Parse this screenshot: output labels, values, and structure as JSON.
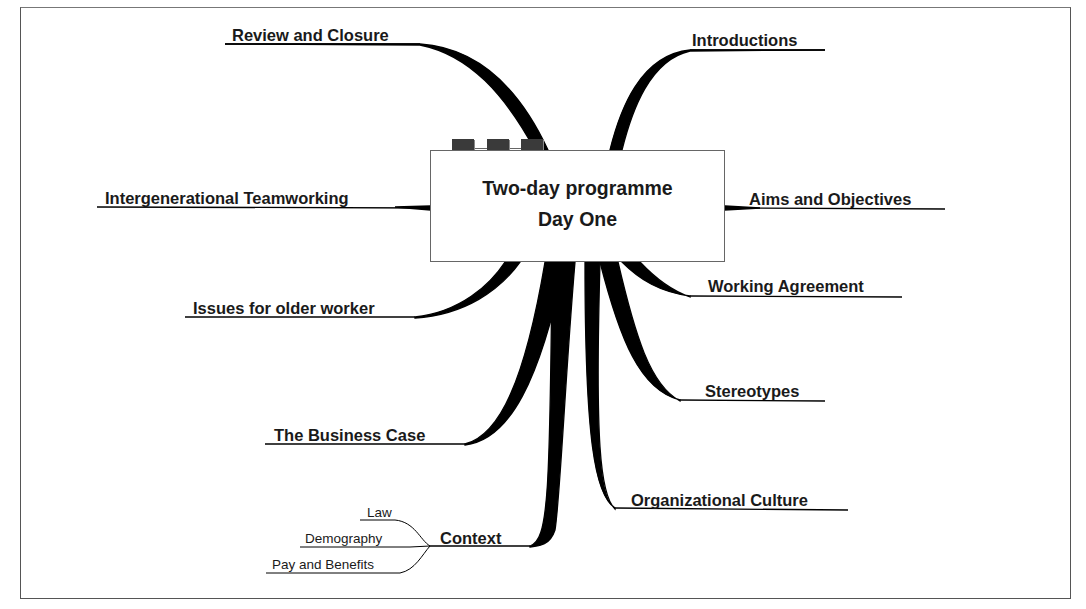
{
  "central_topic": {
    "line1": "Two-day programme",
    "line2": "Day One"
  },
  "branches": {
    "review": "Review and Closure",
    "introductions": "Introductions",
    "intergenerational": "Intergenerational Teamworking",
    "aims": "Aims and Objectives",
    "issues": "Issues for older worker",
    "working_agreement": "Working Agreement",
    "stereotypes": "Stereotypes",
    "business_case": "The Business Case",
    "org_culture": "Organizational Culture",
    "context": {
      "label": "Context",
      "children": [
        "Law",
        "Demography",
        "Pay and Benefits"
      ]
    }
  },
  "colors": {
    "branch": "#000000",
    "text": "#1a1a1a",
    "tab": "#3a3a3a",
    "border": "#666666"
  }
}
